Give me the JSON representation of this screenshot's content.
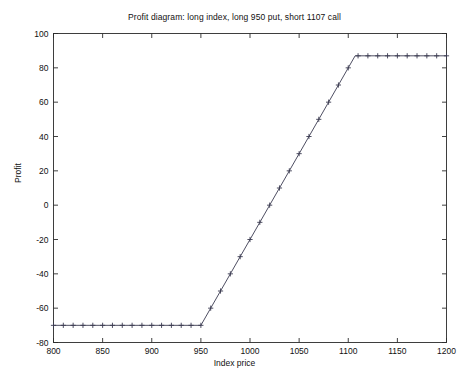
{
  "chart_data": {
    "type": "line",
    "title": "Profit diagram: long index, long 950 put, short 1107 call",
    "xlabel": "Index price",
    "ylabel": "Profit",
    "xlim": [
      800,
      1200
    ],
    "ylim": [
      -80,
      100
    ],
    "xticks": [
      800,
      850,
      900,
      950,
      1000,
      1050,
      1100,
      1150,
      1200
    ],
    "xticklabels": [
      "800",
      "850",
      "900",
      "950",
      "1000",
      "1050",
      "1100",
      "1150",
      "1200"
    ],
    "yticks": [
      -80,
      -60,
      -40,
      -20,
      0,
      20,
      40,
      60,
      80,
      100
    ],
    "yticklabels": [
      "-80",
      "-60",
      "-40",
      "-20",
      "0",
      "20",
      "40",
      "60",
      "80",
      "100"
    ],
    "grid": false,
    "legend": null,
    "marker": "plus",
    "line_color": "#3a3a50",
    "series": [
      {
        "name": "Profit",
        "x": [
          800,
          810,
          820,
          830,
          840,
          850,
          860,
          870,
          880,
          890,
          900,
          910,
          920,
          930,
          940,
          950,
          960,
          970,
          980,
          990,
          1000,
          1010,
          1020,
          1030,
          1040,
          1050,
          1060,
          1070,
          1080,
          1090,
          1100,
          1107,
          1110,
          1120,
          1130,
          1140,
          1150,
          1160,
          1170,
          1180,
          1190,
          1200
        ],
        "y": [
          -70,
          -70,
          -70,
          -70,
          -70,
          -70,
          -70,
          -70,
          -70,
          -70,
          -70,
          -70,
          -70,
          -70,
          -70,
          -70,
          -60,
          -50,
          -40,
          -30,
          -20,
          -10,
          0,
          10,
          20,
          30,
          40,
          50,
          60,
          70,
          80,
          87,
          87,
          87,
          87,
          87,
          87,
          87,
          87,
          87,
          87,
          87
        ]
      }
    ],
    "annotations": {
      "floor_profit": -70,
      "cap_profit": 87,
      "put_strike": 950,
      "call_strike": 1107
    }
  }
}
